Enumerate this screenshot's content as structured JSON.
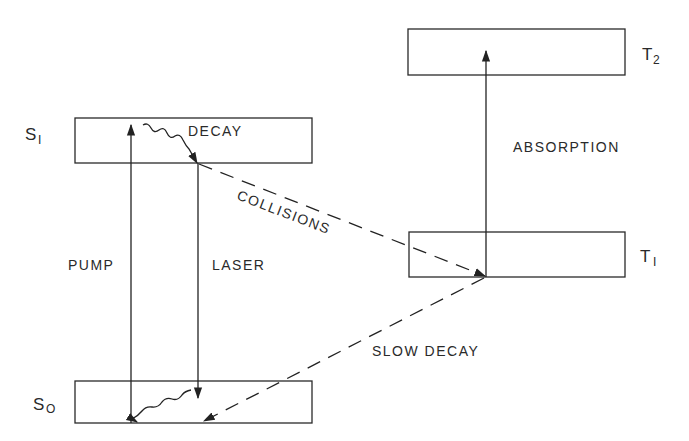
{
  "diagram": {
    "type": "energy-level-diagram",
    "levels": [
      {
        "id": "S1",
        "label": "S",
        "subscript": "1",
        "x": 75,
        "y": 118,
        "w": 237,
        "h": 45
      },
      {
        "id": "S0",
        "label": "S",
        "subscript": "O",
        "x": 75,
        "y": 381,
        "w": 237,
        "h": 42
      },
      {
        "id": "T2",
        "label": "T",
        "subscript": "2",
        "x": 408,
        "y": 29,
        "w": 217,
        "h": 46
      },
      {
        "id": "T1",
        "label": "T",
        "subscript": "1",
        "x": 409,
        "y": 232,
        "w": 216,
        "h": 45
      }
    ],
    "transitions": [
      {
        "id": "pump",
        "label": "PUMP",
        "from": "S0",
        "to": "S1",
        "style": "solid"
      },
      {
        "id": "laser",
        "label": "LASER",
        "from": "S1",
        "to": "S0",
        "style": "solid"
      },
      {
        "id": "decay",
        "label": "DECAY",
        "from": "S1",
        "to": "S1",
        "style": "wavy"
      },
      {
        "id": "collisions",
        "label": "COLLISIONS",
        "from": "S1",
        "to": "T1",
        "style": "dashed"
      },
      {
        "id": "absorption",
        "label": "ABSORPTION",
        "from": "T1",
        "to": "T2",
        "style": "solid"
      },
      {
        "id": "slow_decay",
        "label": "SLOW DECAY",
        "from": "T1",
        "to": "S0",
        "style": "dashed"
      },
      {
        "id": "s0_relax",
        "label": "",
        "from": "S0",
        "to": "S0",
        "style": "wavy"
      }
    ]
  },
  "labels": {
    "s1_main": "S",
    "s1_sub": "I",
    "s0_main": "S",
    "s0_sub": "O",
    "t2_main": "T",
    "t2_sub": "2",
    "t1_main": "T",
    "t1_sub": "I",
    "decay": "DECAY",
    "pump": "PUMP",
    "laser": "LASER",
    "collisions": "COLLISIONS",
    "absorption": "ABSORPTION",
    "slow_decay": "SLOW DECAY"
  }
}
